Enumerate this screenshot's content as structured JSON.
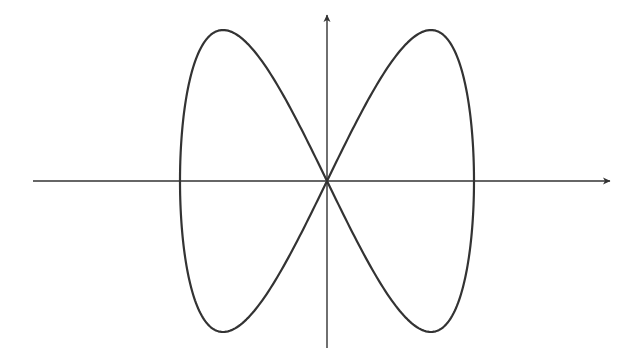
{
  "figure": {
    "type": "lissajous-curve",
    "colors": {
      "background": "#ffffff",
      "axis": "#333333",
      "curve": "#333333"
    },
    "origin_px": [
      327,
      181
    ],
    "x_amplitude_px": 147,
    "y_amplitude_px": 151,
    "x_axis": {
      "from_px": 33,
      "to_px": 610,
      "arrow": true
    },
    "y_axis": {
      "from_px": 348,
      "to_px": 15,
      "arrow": true
    },
    "curve": {
      "x_equation": "sin(t)",
      "y_equation": "sin(2t)",
      "t_range": [
        0,
        6.2832
      ],
      "key_points_px": [
        {
          "label": "origin",
          "x": 327,
          "y": 181
        },
        {
          "label": "upper-left peak",
          "x": 223,
          "y": 30
        },
        {
          "label": "upper-right peak",
          "x": 431,
          "y": 30
        },
        {
          "label": "lower-left trough",
          "x": 223,
          "y": 332
        },
        {
          "label": "lower-right trough",
          "x": 431,
          "y": 332
        },
        {
          "label": "left extreme",
          "x": 180,
          "y": 181
        },
        {
          "label": "right extreme",
          "x": 474,
          "y": 181
        }
      ]
    }
  }
}
